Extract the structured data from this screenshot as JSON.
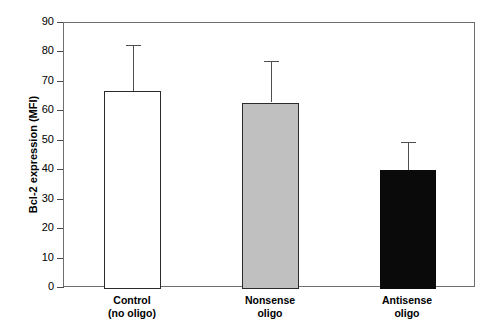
{
  "chart_data": {
    "type": "bar",
    "title": "",
    "xlabel": "",
    "ylabel": "Bcl-2 expression (MFI)",
    "ylim": [
      0,
      90
    ],
    "yticks": [
      0,
      10,
      20,
      30,
      40,
      50,
      60,
      70,
      80,
      90
    ],
    "ytick_labels": [
      "0",
      "10",
      "20",
      "30",
      "40",
      "50",
      "60",
      "70",
      "80",
      "90"
    ],
    "grid": false,
    "legend": "none",
    "categories": [
      "Control\n(no oligo)",
      "Nonsense\noligo",
      "Antisense\noligo"
    ],
    "values": [
      67,
      63,
      40
    ],
    "errors": [
      15.5,
      14,
      9.5
    ],
    "bars": [
      {
        "label_line1": "Control",
        "label_line2": "(no oligo)",
        "value": 67,
        "error": 15.5,
        "error_top": 82.5,
        "fill": "#ffffff",
        "fill_name": "white",
        "edge": "#2b2b2b"
      },
      {
        "label_line1": "Nonsense",
        "label_line2": "oligo",
        "value": 63,
        "error": 14,
        "error_top": 77,
        "fill": "#c0c0c0",
        "fill_name": "gray",
        "edge": "#2b2b2b"
      },
      {
        "label_line1": "Antisense",
        "label_line2": "oligo",
        "value": 40,
        "error": 9.5,
        "error_top": 49.5,
        "fill": "#0a0a0a",
        "fill_name": "black",
        "edge": "#0a0a0a"
      }
    ],
    "axis_color": "#6e6e6e",
    "background": "#ffffff"
  }
}
